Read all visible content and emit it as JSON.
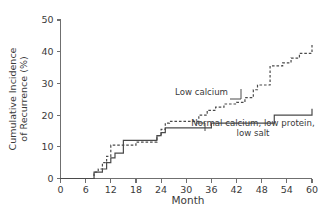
{
  "chart_data": {
    "type": "line",
    "title": "",
    "subtitle": "",
    "xlabel": "Month",
    "ylabel": "Cumulative Incidence of Recurrence (%)",
    "ylabel_line1": "Cumulative Incidence",
    "ylabel_line2": "of Recurrence (%)",
    "xlim": [
      0,
      60
    ],
    "ylim": [
      0,
      50
    ],
    "xticks": [
      0,
      6,
      12,
      18,
      24,
      30,
      36,
      42,
      48,
      54,
      60
    ],
    "xtick_labels": [
      "0",
      "6",
      "12",
      "18",
      "24",
      "30",
      "36",
      "42",
      "48",
      "54",
      "60"
    ],
    "yticks": [
      0,
      10,
      20,
      30,
      40,
      50
    ],
    "ytick_labels": [
      "0",
      "10",
      "20",
      "30",
      "40",
      "50"
    ],
    "grid": false,
    "legend_position": "inline-annotations",
    "step_style": "post",
    "series": [
      {
        "name": "Low calcium",
        "style": "dashed",
        "color": "#4a4a4a",
        "x": [
          0,
          8,
          9,
          10,
          11,
          12,
          15,
          17,
          18,
          23,
          24,
          25,
          26,
          32,
          33,
          35,
          37,
          39,
          40,
          42,
          44,
          45,
          46,
          47,
          48,
          50,
          53,
          55,
          57,
          59,
          60
        ],
        "y": [
          0,
          2,
          3,
          5,
          7,
          10.5,
          10.5,
          10.5,
          11.5,
          13.5,
          15.5,
          17.5,
          18,
          18,
          20,
          21.5,
          22.5,
          23.5,
          23.5,
          24,
          25.5,
          25.5,
          28,
          29.5,
          29.5,
          35.5,
          36.5,
          38,
          39.5,
          39.5,
          42.5
        ]
      },
      {
        "name": "Normal calcium, low protein, low salt",
        "style": "solid",
        "color": "#4a4a4a",
        "x": [
          0,
          8,
          10,
          11,
          12,
          13,
          15,
          16,
          23,
          24,
          25,
          26,
          36,
          48,
          51,
          60
        ],
        "y": [
          0,
          2,
          3,
          5,
          6.5,
          8,
          12,
          12,
          13.5,
          14.5,
          16,
          16,
          17.5,
          17.5,
          20,
          22
        ]
      }
    ],
    "annotations": [
      {
        "text": "Low calcium",
        "x": 33,
        "y": 27
      },
      {
        "text": "Normal calcium, low protein,",
        "x": 46,
        "y": 15.5
      },
      {
        "text": "low salt",
        "x": 46,
        "y": 13
      }
    ]
  }
}
